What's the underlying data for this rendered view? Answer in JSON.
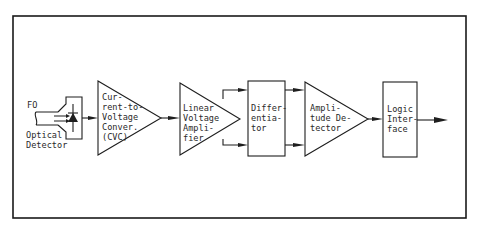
{
  "diagram": {
    "type": "block-diagram",
    "title": "",
    "colors": {
      "line": "#1e1e1e",
      "text": "#2a2a2a",
      "background": "#ffffff"
    },
    "input": {
      "fiber_label": "FO",
      "detector_label": [
        "Optical",
        "Detector"
      ]
    },
    "blocks": [
      {
        "id": "cvc",
        "shape": "triangle",
        "label": [
          "Cur-",
          "rent-to-",
          "Voltage",
          "Conver.",
          "(CVC)"
        ]
      },
      {
        "id": "lva",
        "shape": "triangle",
        "label": [
          "Linear",
          "Voltage",
          "Ampli-",
          "fier"
        ]
      },
      {
        "id": "diff",
        "shape": "rectangle",
        "label": [
          "Differ-",
          "entia-",
          "tor"
        ]
      },
      {
        "id": "ampdet",
        "shape": "triangle",
        "label": [
          "Ampli-",
          "tude De-",
          "tector"
        ]
      },
      {
        "id": "logic",
        "shape": "rectangle",
        "label": [
          "Logic",
          "Inter-",
          "face"
        ]
      }
    ],
    "connections": [
      {
        "from": "optical-detector",
        "to": "cvc"
      },
      {
        "from": "cvc",
        "to": "lva"
      },
      {
        "from": "lva",
        "to": "diff",
        "paths": 2
      },
      {
        "from": "diff",
        "to": "ampdet",
        "paths": 2
      },
      {
        "from": "ampdet",
        "to": "logic"
      },
      {
        "from": "logic",
        "to": "output"
      }
    ]
  }
}
